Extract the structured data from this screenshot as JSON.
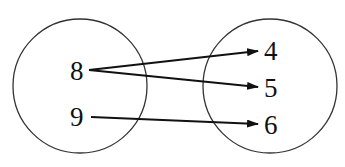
{
  "diagram": {
    "type": "mapping",
    "domain": {
      "label": "domain-set",
      "values": [
        "8",
        "9"
      ]
    },
    "range": {
      "label": "range-set",
      "values": [
        "4",
        "5",
        "6"
      ]
    },
    "mappings": [
      {
        "from": "8",
        "to": "4"
      },
      {
        "from": "8",
        "to": "5"
      },
      {
        "from": "9",
        "to": "6"
      }
    ],
    "colors": {
      "stroke": "#333333",
      "arrow": "#111111",
      "text": "#111111",
      "background": "#ffffff"
    }
  }
}
